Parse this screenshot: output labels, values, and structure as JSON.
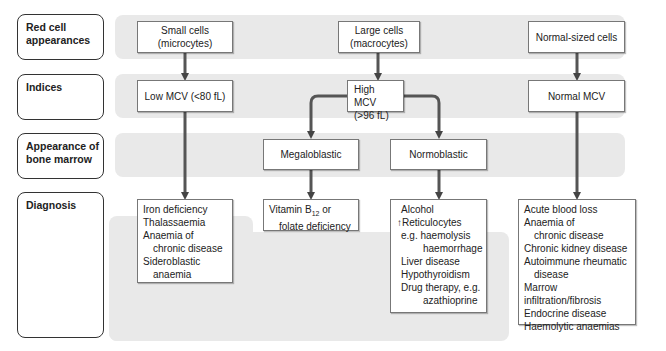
{
  "row_labels": {
    "red_cell": "Red cell appearances",
    "indices": "Indices",
    "marrow": "Appearance of bone marrow",
    "diagnosis": "Diagnosis"
  },
  "red_cell": {
    "small_1": "Small cells",
    "small_2": "(microcytes)",
    "large_1": "Large cells",
    "large_2": "(macrocytes)",
    "normal": "Normal-sized cells"
  },
  "indices": {
    "low": "Low MCV (<80 fL)",
    "high_1": "High MCV",
    "high_2": "(>96 fL)",
    "normal": "Normal MCV"
  },
  "marrow": {
    "megaloblastic": "Megaloblastic",
    "normoblastic": "Normoblastic"
  },
  "diagnosis": {
    "microcytic": [
      "Iron deficiency",
      "Thalassaemia",
      "Anaemia of",
      "chronic disease",
      "Sideroblastic",
      "anaemia"
    ],
    "megaloblastic": {
      "vit": "Vitamin B",
      "sub": "12",
      "or": " or",
      "folate": "folate deficiency"
    },
    "normoblastic": [
      "Alcohol",
      "↑Reticulocytes",
      "e.g. haemolysis",
      "haemorrhage",
      "Liver disease",
      "Hypothyroidism",
      "Drug therapy, e.g.",
      "azathioprine"
    ],
    "normocytic": [
      "Acute blood loss",
      "Anaemia of",
      "chronic disease",
      "Chronic kidney disease",
      "Autoimmune rheumatic",
      "disease",
      "Marrow infiltration/fibrosis",
      "Endocrine disease",
      "Haemolytic anaemias"
    ]
  },
  "colors": {
    "band": "#e9e9e9",
    "arrow": "#555555",
    "border": "#333333"
  }
}
